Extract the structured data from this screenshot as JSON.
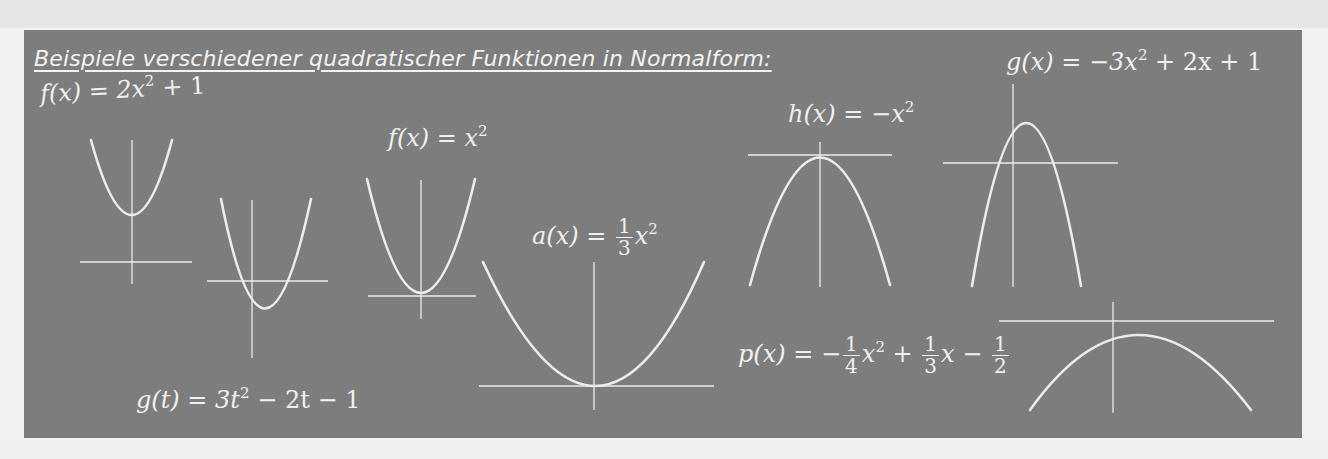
{
  "title": "Beispiele verschiedener quadratischer Funktionen in Normalform:",
  "formulas": {
    "f1_lhs": "f(x) = 2x",
    "f1_exp": "2",
    "f1_rest": " + 1",
    "g_x": "g(x) = −3x",
    "g_x_exp": "2",
    "g_x_rest": " + 2x + 1",
    "f2": "f(x) = x",
    "f2_exp": "2",
    "h": "h(x) = −x",
    "h_exp": "2",
    "a_lhs": "a(x) = ",
    "a_num": "1",
    "a_den": "3",
    "a_var": "x",
    "a_exp": "2",
    "p_lhs": "p(x) = −",
    "p_f1_num": "1",
    "p_f1_den": "4",
    "p_var1": "x",
    "p_exp": "2",
    "p_plus": " + ",
    "p_f2_num": "1",
    "p_f2_den": "3",
    "p_var2": "x − ",
    "p_f3_num": "1",
    "p_f3_den": "2",
    "g_t": "g(t) = 3t",
    "g_t_exp": "2",
    "g_t_rest": " − 2t − 1"
  },
  "graphs": [
    {
      "id": "f1",
      "function": "f(x) = 2x^2 + 1",
      "opens": "up"
    },
    {
      "id": "g_t",
      "function": "g(t) = 3t^2 - 2t - 1",
      "opens": "up"
    },
    {
      "id": "f2",
      "function": "f(x) = x^2",
      "opens": "up"
    },
    {
      "id": "a",
      "function": "a(x) = 1/3 x^2",
      "opens": "up"
    },
    {
      "id": "h",
      "function": "h(x) = -x^2",
      "opens": "down"
    },
    {
      "id": "g_x",
      "function": "g(x) = -3x^2 + 2x + 1",
      "opens": "down"
    },
    {
      "id": "p",
      "function": "p(x) = -1/4 x^2 + 1/3 x - 1/2",
      "opens": "down"
    }
  ],
  "colors": {
    "board": "#7d7d7d",
    "chalk": "#ececec",
    "page": "#f2f2f2"
  }
}
